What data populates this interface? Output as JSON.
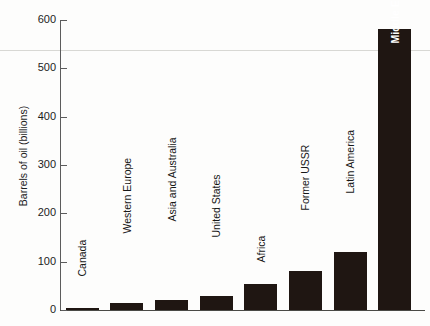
{
  "chart_data": {
    "type": "bar",
    "title": "",
    "xlabel": "",
    "ylabel": "Barrels of oil (billions)",
    "ylim": [
      0,
      600
    ],
    "yticks": [
      0,
      100,
      200,
      300,
      400,
      500,
      600
    ],
    "ytick_labels": [
      "0",
      "100",
      "200",
      "300",
      "400",
      "500",
      "600"
    ],
    "grid": false,
    "legend": "none",
    "categories": [
      "Canada",
      "Western Europe",
      "Asia and Australia",
      "United States",
      "Africa",
      "Former USSR",
      "Latin America",
      "Middle East"
    ],
    "values": [
      5,
      14,
      20,
      30,
      54,
      80,
      120,
      582
    ],
    "bar_color": "#1f1612",
    "label_placement": [
      "outside",
      "outside",
      "outside",
      "outside",
      "outside",
      "outside",
      "outside",
      "inside"
    ]
  },
  "axis": {
    "ylabel": "Barrels of oil (billions)"
  }
}
